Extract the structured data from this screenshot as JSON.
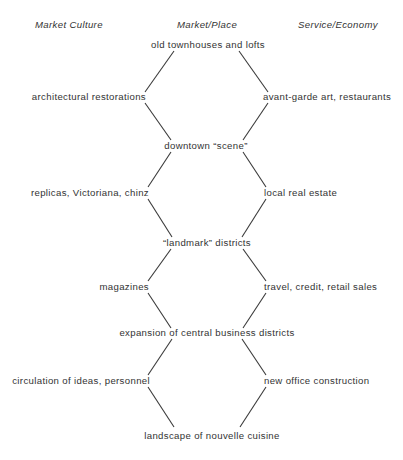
{
  "headers": {
    "left": "Market Culture",
    "center": "Market/Place",
    "right": "Service/Economy"
  },
  "center_nodes": [
    "old townhouses and lofts",
    "downtown “scene”",
    "“landmark” districts",
    "expansion of central business districts",
    "landscape of nouvelle cuisine"
  ],
  "left_nodes": [
    "architectural restorations",
    "replicas, Victoriana, chinz",
    "magazines",
    "circulation of ideas, personnel"
  ],
  "right_nodes": [
    "avant-garde art, restaurants",
    "local real estate",
    "travel, credit, retail sales",
    "new office construction"
  ],
  "colors": {
    "text": "#333333",
    "line": "#3a3a3a",
    "background": "#ffffff"
  }
}
